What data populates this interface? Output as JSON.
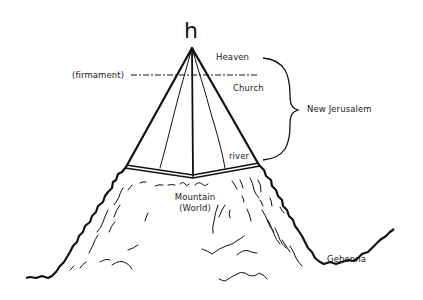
{
  "diagram": {
    "symbol": "h",
    "labels": {
      "heaven": "Heaven",
      "firmament": "(firmament)",
      "church": "Church",
      "new_jerusalem": "New Jerusalem",
      "river": "river",
      "mountain": "Mountain",
      "world": "(World)",
      "gehenna": "Gehenna"
    },
    "colors": {
      "ink": "#111111",
      "background": "#ffffff"
    }
  }
}
